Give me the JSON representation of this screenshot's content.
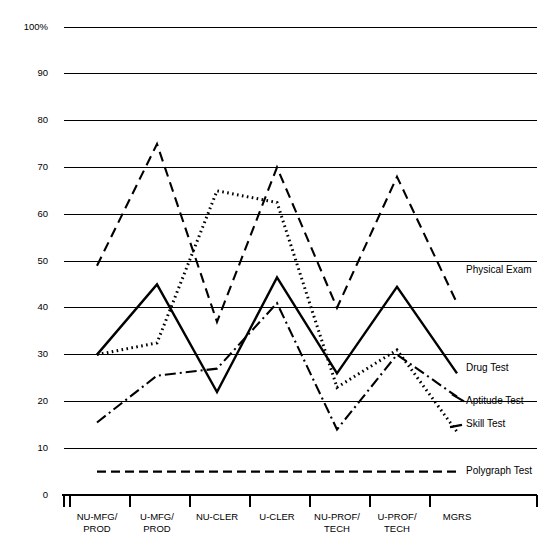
{
  "chart_data": {
    "type": "line",
    "title": "",
    "xlabel": "",
    "ylabel": "",
    "ylim": [
      0,
      100
    ],
    "grid": true,
    "legend_position": "right-inline-labels",
    "categories": [
      "NU-MFG/\nPROD",
      "U-MFG/\nPROD",
      "NU-CLER",
      "U-CLER",
      "NU-PROF/\nTECH",
      "U-PROF/\nTECH",
      "MGRS"
    ],
    "category_lines": [
      [
        "NU-MFG/",
        "PROD"
      ],
      [
        "U-MFG/",
        "PROD"
      ],
      [
        "NU-CLER",
        ""
      ],
      [
        "U-CLER",
        ""
      ],
      [
        "NU-PROF/",
        "TECH"
      ],
      [
        "U-PROF/",
        "TECH"
      ],
      [
        "MGRS",
        ""
      ]
    ],
    "y_ticks": [
      0,
      10,
      20,
      30,
      40,
      50,
      60,
      70,
      80,
      90,
      100
    ],
    "y_tick_labels": [
      "0",
      "10",
      "20",
      "30",
      "40",
      "50",
      "60",
      "70",
      "80",
      "90",
      "100%"
    ],
    "series": [
      {
        "name": "Physical Exam",
        "style": "dashed",
        "dasharray": "10,6",
        "width": 2.1,
        "values": [
          49,
          75,
          37,
          70,
          40,
          68,
          41
        ]
      },
      {
        "name": "Drug Test",
        "style": "solid",
        "dasharray": "none",
        "width": 2.4,
        "values": [
          30,
          45,
          22,
          46.5,
          26,
          44.5,
          26
        ]
      },
      {
        "name": "Skill Test",
        "style": "dotted",
        "dasharray": "1.6,3.4",
        "width": 3.0,
        "values": [
          30,
          32.5,
          65,
          62.5,
          23,
          31,
          13.5
        ]
      },
      {
        "name": "Aptitude Test",
        "style": "dash-dot",
        "dasharray": "11,4,2,4",
        "width": 2.1,
        "values": [
          15.5,
          25.5,
          27,
          41,
          14,
          30,
          21
        ]
      },
      {
        "name": "Polygraph Test",
        "style": "dashed",
        "dasharray": "9,5",
        "width": 2.2,
        "values": [
          5,
          5,
          5,
          5,
          5,
          5,
          5
        ]
      }
    ],
    "series_labels": [
      {
        "name": "Physical Exam",
        "value_at_label": 48
      },
      {
        "name": "Drug Test",
        "value_at_label": 27
      },
      {
        "name": "Aptitude Test",
        "value_at_label": 20
      },
      {
        "name": "Skill Test",
        "value_at_label": 15
      },
      {
        "name": "Polygraph Test",
        "value_at_label": 5
      }
    ]
  },
  "colors": {
    "ink": "#000000",
    "background": "#ffffff",
    "grid": "#000000"
  }
}
